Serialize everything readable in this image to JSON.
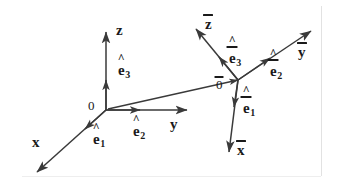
{
  "figure": {
    "background_color": "#ffffff",
    "stroke_color": "#3a3a3a",
    "text_color": "#1a1a1a",
    "width": 338,
    "height": 192
  },
  "frame_unbarred": {
    "origin_label": "0",
    "axes": [
      {
        "name": "x",
        "label": "x"
      },
      {
        "name": "y",
        "label": "y"
      },
      {
        "name": "z",
        "label": "z"
      }
    ],
    "basis_vectors": [
      {
        "name": "e1",
        "letter": "e",
        "subscript": "1"
      },
      {
        "name": "e2",
        "letter": "e",
        "subscript": "2"
      },
      {
        "name": "e3",
        "letter": "e",
        "subscript": "3"
      }
    ]
  },
  "frame_barred": {
    "origin_label": "0",
    "axes": [
      {
        "name": "x-bar",
        "label": "x"
      },
      {
        "name": "y-bar",
        "label": "y"
      },
      {
        "name": "z-bar",
        "label": "z"
      }
    ],
    "basis_vectors": [
      {
        "name": "e1-bar",
        "letter": "e",
        "subscript": "1"
      },
      {
        "name": "e2-bar",
        "letter": "e",
        "subscript": "2"
      },
      {
        "name": "e3-bar",
        "letter": "e",
        "subscript": "3"
      }
    ]
  }
}
